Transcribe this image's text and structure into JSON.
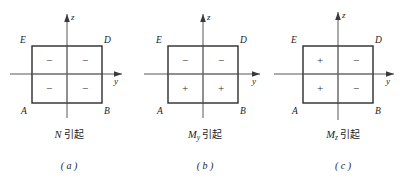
{
  "figure": {
    "panels": [
      {
        "id": "a",
        "index_label": "( a )",
        "cause_symbol": "N",
        "cause_subscript": "",
        "cause_text": "引起",
        "axis_z_label": "z",
        "axis_y_label": "y",
        "corners": {
          "top_left": "E",
          "top_right": "D",
          "bottom_left": "A",
          "bottom_right": "B"
        },
        "signs": {
          "top_left": "−",
          "top_right": "−",
          "bottom_left": "−",
          "bottom_right": "−"
        }
      },
      {
        "id": "b",
        "index_label": "( b )",
        "cause_symbol": "M",
        "cause_subscript": "y",
        "cause_text": "引起",
        "axis_z_label": "z",
        "axis_y_label": "y",
        "corners": {
          "top_left": "E",
          "top_right": "D",
          "bottom_left": "A",
          "bottom_right": "B"
        },
        "signs": {
          "top_left": "−",
          "top_right": "−",
          "bottom_left": "+",
          "bottom_right": "+"
        }
      },
      {
        "id": "c",
        "index_label": "( c )",
        "cause_symbol": "M",
        "cause_subscript": "z",
        "cause_text": "引起",
        "axis_z_label": "z",
        "axis_y_label": "y",
        "corners": {
          "top_left": "E",
          "top_right": "D",
          "bottom_left": "A",
          "bottom_right": "B"
        },
        "signs": {
          "top_left": "+",
          "top_right": "−",
          "bottom_left": "+",
          "bottom_right": "−"
        }
      }
    ]
  }
}
